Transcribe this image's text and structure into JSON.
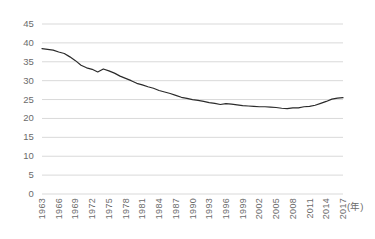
{
  "chart_data": {
    "type": "line",
    "title": "",
    "xlabel": "(年)",
    "ylabel": "エンゲル係数 (%)",
    "xlim": [
      1963,
      2017
    ],
    "ylim": [
      0,
      45
    ],
    "grid": true,
    "legend": "none",
    "line_color": "#2b2b2b",
    "gridline_color": "#d9d9d9",
    "ytick_labels": [
      "45",
      "40",
      "35",
      "30",
      "25",
      "20",
      "15",
      "10",
      "5",
      "0"
    ],
    "ytick_values": [
      45,
      40,
      35,
      30,
      25,
      20,
      15,
      10,
      5,
      0
    ],
    "xtick_labels": [
      "1963",
      "1966",
      "1969",
      "1972",
      "1975",
      "1978",
      "1981",
      "1984",
      "1987",
      "1990",
      "1993",
      "1996",
      "1999",
      "2002",
      "2005",
      "2008",
      "2011",
      "2014",
      "2017"
    ],
    "xtick_values": [
      1963,
      1966,
      1969,
      1972,
      1975,
      1978,
      1981,
      1984,
      1987,
      1990,
      1993,
      1996,
      1999,
      2002,
      2005,
      2008,
      2011,
      2014,
      2017
    ],
    "x": [
      1963,
      1964,
      1965,
      1966,
      1967,
      1968,
      1969,
      1970,
      1971,
      1972,
      1973,
      1974,
      1975,
      1976,
      1977,
      1978,
      1979,
      1980,
      1981,
      1982,
      1983,
      1984,
      1985,
      1986,
      1987,
      1988,
      1989,
      1990,
      1991,
      1992,
      1993,
      1994,
      1995,
      1996,
      1997,
      1998,
      1999,
      2000,
      2001,
      2002,
      2003,
      2004,
      2005,
      2006,
      2007,
      2008,
      2009,
      2010,
      2011,
      2012,
      2013,
      2014,
      2015,
      2016,
      2017
    ],
    "values": [
      38.5,
      38.3,
      38.1,
      37.6,
      37.2,
      36.3,
      35.3,
      34.1,
      33.4,
      33.0,
      32.3,
      33.1,
      32.6,
      32.0,
      31.2,
      30.6,
      30.0,
      29.3,
      28.9,
      28.4,
      28.0,
      27.4,
      27.0,
      26.6,
      26.1,
      25.6,
      25.3,
      25.0,
      24.8,
      24.5,
      24.2,
      24.0,
      23.7,
      23.9,
      23.8,
      23.6,
      23.4,
      23.3,
      23.2,
      23.1,
      23.1,
      23.0,
      22.9,
      22.7,
      22.6,
      22.8,
      22.8,
      23.1,
      23.2,
      23.5,
      24.0,
      24.5,
      25.1,
      25.4,
      25.5
    ],
    "series_name": "エンゲル係数"
  }
}
